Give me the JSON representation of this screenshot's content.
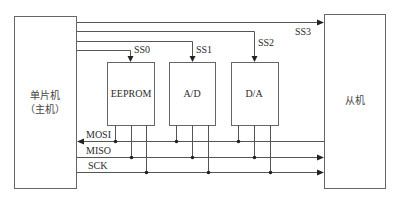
{
  "diagram": {
    "type": "SPI multi-slave connection diagram",
    "master": {
      "line1": "单片机",
      "line2": "（主机）"
    },
    "slave": {
      "label": "从机"
    },
    "devices": [
      {
        "label": "EEPROM",
        "select": "SS0"
      },
      {
        "label": "A/D",
        "select": "SS1"
      },
      {
        "label": "D/A",
        "select": "SS2"
      }
    ],
    "slave_select": "SS3",
    "bus": {
      "mosi": "MOSI",
      "miso": "MISO",
      "sck": "SCK"
    },
    "colors": {
      "line": "#555555",
      "box_border": "#666666",
      "text": "#2a2a2a"
    }
  }
}
